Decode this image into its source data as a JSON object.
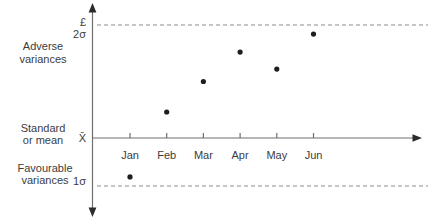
{
  "chart_data": {
    "type": "scatter",
    "categories": [
      "Jan",
      "Feb",
      "Mar",
      "Apr",
      "May",
      "Jun"
    ],
    "values_sigma": [
      -0.81,
      0.46,
      1.0,
      1.52,
      1.22,
      1.84
    ],
    "y_axis": {
      "currency_label": "£",
      "upper_limit_label": "2σ",
      "mean_label": "X̄",
      "lower_limit_label": "1σ"
    },
    "region_labels": {
      "adverse": [
        "Adverse",
        "variances"
      ],
      "standard": [
        "Standard",
        "or mean"
      ],
      "favourable": [
        "Favourable",
        "variances"
      ]
    },
    "reference_lines": [
      {
        "position": "upper",
        "sigma": 2,
        "style": "dashed"
      },
      {
        "position": "lower",
        "sigma": -1,
        "style": "dashed"
      }
    ],
    "layout": {
      "axis_x": 92.5,
      "axis_top_y": 8,
      "axis_bottom_y": 212,
      "baseline_y": 138,
      "axis_right_x": 414,
      "upper_dash_y": 25,
      "lower_dash_y": 186,
      "dash_start_x": 97,
      "dash_end_x": 428,
      "x_start": 130,
      "x_step": 36.7,
      "sigma_px_up": 56.5,
      "sigma_px_down": 48,
      "point_radius": 2.6,
      "tick_len": 5,
      "month_label_y": 159
    },
    "colors": {
      "axis": "#6e6e6e",
      "axis_head": "#2b2b2b",
      "dash": "#8c8c8c",
      "point": "#1e1e1e",
      "text": "#3c3c3c"
    }
  }
}
